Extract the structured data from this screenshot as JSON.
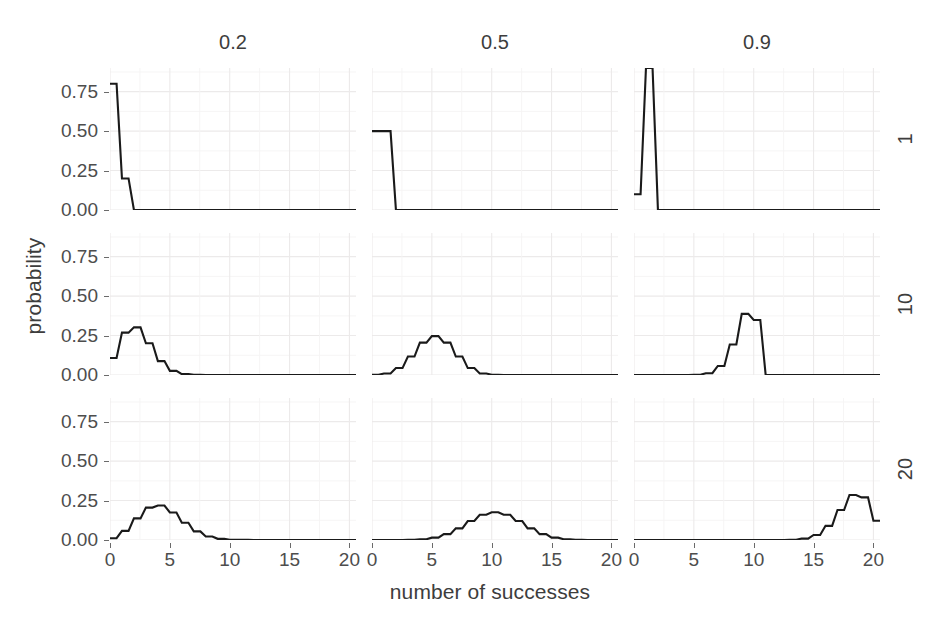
{
  "figure": {
    "xlabel": "number of successes",
    "ylabel": "probability",
    "line_color": "#1a1a1a",
    "grid_color": "#eceaea",
    "background": "#ffffff"
  },
  "axes": {
    "y_ticks": [
      "0.00",
      "0.25",
      "0.50",
      "0.75"
    ],
    "y_tick_values": [
      0.0,
      0.25,
      0.5,
      0.75
    ],
    "x_ticks": [
      "0",
      "5",
      "10",
      "15",
      "20"
    ],
    "x_tick_values": [
      0,
      5,
      10,
      15,
      20
    ],
    "xlim": [
      0,
      20
    ],
    "ylim": [
      0,
      0.9
    ]
  },
  "facets": {
    "column_label_title": "probability of success",
    "column_labels": [
      "0.2",
      "0.5",
      "0.9"
    ],
    "row_label_title": "number of trials",
    "row_labels": [
      "1",
      "10",
      "20"
    ]
  },
  "chart_data": {
    "type": "line",
    "title": "",
    "subtitle": "",
    "xlabel": "number of successes",
    "ylabel": "probability",
    "xlim": [
      0,
      20
    ],
    "ylim": [
      0,
      0.9
    ],
    "grid": true,
    "legend": "none",
    "facet_type": "grid",
    "facet_columns": {
      "name": "p",
      "levels": [
        0.2,
        0.5,
        0.9
      ],
      "labels": [
        "0.2",
        "0.5",
        "0.9"
      ]
    },
    "facet_rows": {
      "name": "n",
      "levels": [
        1,
        10,
        20
      ],
      "labels": [
        "1",
        "10",
        "20"
      ]
    },
    "x": [
      0,
      1,
      2,
      3,
      4,
      5,
      6,
      7,
      8,
      9,
      10,
      11,
      12,
      13,
      14,
      15,
      16,
      17,
      18,
      19,
      20
    ],
    "panels": [
      {
        "row": 0,
        "col": 0,
        "n": 1,
        "p": 0.2,
        "row_label": "1",
        "col_label": "0.2",
        "values": [
          0.8,
          0.2,
          0,
          0,
          0,
          0,
          0,
          0,
          0,
          0,
          0,
          0,
          0,
          0,
          0,
          0,
          0,
          0,
          0,
          0,
          0
        ]
      },
      {
        "row": 0,
        "col": 1,
        "n": 1,
        "p": 0.5,
        "row_label": "1",
        "col_label": "0.5",
        "values": [
          0.5,
          0.5,
          0,
          0,
          0,
          0,
          0,
          0,
          0,
          0,
          0,
          0,
          0,
          0,
          0,
          0,
          0,
          0,
          0,
          0,
          0
        ]
      },
      {
        "row": 0,
        "col": 2,
        "n": 1,
        "p": 0.9,
        "row_label": "1",
        "col_label": "0.9",
        "values": [
          0.1,
          0.9,
          0,
          0,
          0,
          0,
          0,
          0,
          0,
          0,
          0,
          0,
          0,
          0,
          0,
          0,
          0,
          0,
          0,
          0,
          0
        ]
      },
      {
        "row": 1,
        "col": 0,
        "n": 10,
        "p": 0.2,
        "row_label": "10",
        "col_label": "0.2",
        "values": [
          0.1074,
          0.2684,
          0.302,
          0.2013,
          0.0881,
          0.0264,
          0.0055,
          0.0008,
          0.0001,
          0.0,
          0.0,
          0,
          0,
          0,
          0,
          0,
          0,
          0,
          0,
          0,
          0
        ]
      },
      {
        "row": 1,
        "col": 1,
        "n": 10,
        "p": 0.5,
        "row_label": "10",
        "col_label": "0.5",
        "values": [
          0.001,
          0.0098,
          0.0439,
          0.1172,
          0.2051,
          0.2461,
          0.2051,
          0.1172,
          0.0439,
          0.0098,
          0.001,
          0,
          0,
          0,
          0,
          0,
          0,
          0,
          0,
          0,
          0
        ]
      },
      {
        "row": 1,
        "col": 2,
        "n": 10,
        "p": 0.9,
        "row_label": "10",
        "col_label": "0.9",
        "values": [
          0.0,
          0.0,
          0.0,
          0.0,
          0.0001,
          0.0015,
          0.0112,
          0.0574,
          0.1937,
          0.3874,
          0.3487,
          0,
          0,
          0,
          0,
          0,
          0,
          0,
          0,
          0,
          0
        ]
      },
      {
        "row": 2,
        "col": 0,
        "n": 20,
        "p": 0.2,
        "row_label": "20",
        "col_label": "0.2",
        "values": [
          0.0115,
          0.0576,
          0.1369,
          0.2054,
          0.2182,
          0.1746,
          0.1091,
          0.0545,
          0.0222,
          0.0074,
          0.002,
          0.0005,
          0.0001,
          0.0,
          0.0,
          0.0,
          0.0,
          0.0,
          0.0,
          0.0,
          0.0
        ]
      },
      {
        "row": 2,
        "col": 1,
        "n": 20,
        "p": 0.5,
        "row_label": "20",
        "col_label": "0.5",
        "values": [
          0.0,
          0.0,
          0.0002,
          0.0011,
          0.0046,
          0.0148,
          0.037,
          0.0739,
          0.1201,
          0.1602,
          0.1762,
          0.1602,
          0.1201,
          0.0739,
          0.037,
          0.0148,
          0.0046,
          0.0011,
          0.0002,
          0.0,
          0.0
        ]
      },
      {
        "row": 2,
        "col": 2,
        "n": 20,
        "p": 0.9,
        "row_label": "20",
        "col_label": "0.9",
        "values": [
          0.0,
          0.0,
          0.0,
          0.0,
          0.0,
          0.0,
          0.0,
          0.0,
          0.0,
          0.0,
          0.0,
          0.0,
          0.0004,
          0.002,
          0.0089,
          0.0319,
          0.0898,
          0.1901,
          0.2852,
          0.2702,
          0.1216
        ]
      }
    ]
  }
}
